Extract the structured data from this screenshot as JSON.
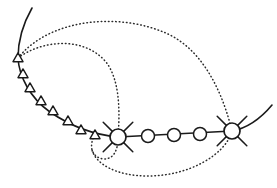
{
  "figure": {
    "width": 277,
    "height": 188,
    "background_color": "#ffffff"
  },
  "style": {
    "solid_stroke_color": "#1a1a1a",
    "dotted_stroke_color": "#2b2b2b",
    "marker_fill_color": "#ffffff",
    "solid_stroke_width": 1.6,
    "dotted_stroke_width": 1.5,
    "dotted_dash_pattern": "0.6 3.0"
  },
  "chart_data": {
    "type": "scatter",
    "xlabel": "",
    "ylabel": "",
    "xlim": [
      0,
      277
    ],
    "ylim": [
      0,
      188
    ],
    "grid": false,
    "legend": "none",
    "series": [
      {
        "name": "solid-trajectory",
        "line_style": "solid",
        "marker": "none",
        "path": "M 32 8 C 24 22, 18 40, 18 58 C 19 76, 30 98, 50 112 C 72 127, 96 135, 118 137 L 232 131 C 248 128, 262 117, 272 105"
      },
      {
        "name": "triangle-markers",
        "marker": "triangle",
        "marker_size": 10,
        "points": [
          {
            "x": 18,
            "y": 58
          },
          {
            "x": 23,
            "y": 74
          },
          {
            "x": 30,
            "y": 88
          },
          {
            "x": 41,
            "y": 101
          },
          {
            "x": 53,
            "y": 111
          },
          {
            "x": 68,
            "y": 121
          },
          {
            "x": 81,
            "y": 130
          },
          {
            "x": 95,
            "y": 135
          }
        ]
      },
      {
        "name": "circle-markers",
        "marker": "circle",
        "marker_radius": 6.5,
        "points": [
          {
            "x": 148,
            "y": 136
          },
          {
            "x": 174,
            "y": 135
          },
          {
            "x": 200,
            "y": 134
          }
        ]
      },
      {
        "name": "junction-nodes",
        "marker": "circle-with-cross",
        "marker_radius": 8,
        "points": [
          {
            "x": 118,
            "y": 137
          },
          {
            "x": 232,
            "y": 131
          }
        ]
      },
      {
        "name": "dotted-arc-upper",
        "line_style": "dotted",
        "marker": "none",
        "path": "M 18 58 C 50 18, 120 12, 168 34 C 206 52, 224 98, 232 131"
      },
      {
        "name": "dotted-arc-middle",
        "line_style": "dotted",
        "marker": "none",
        "path": "M 18 58 C 42 40, 84 36, 106 62 C 120 80, 120 112, 118 137"
      },
      {
        "name": "dotted-arc-lower",
        "line_style": "dotted",
        "marker": "none",
        "path": "M 232 131 C 226 154, 190 176, 148 176 C 116 176, 96 164, 92 150"
      },
      {
        "name": "dotted-loop-small",
        "line_style": "dotted",
        "marker": "none",
        "path": "M 95 135 C 88 146, 92 158, 104 159 C 114 159, 118 150, 118 137"
      }
    ]
  },
  "annotations": {
    "marker_counts": {
      "triangles": 8,
      "circles": 3,
      "junctions": 2,
      "dotted_arcs": 4
    }
  }
}
